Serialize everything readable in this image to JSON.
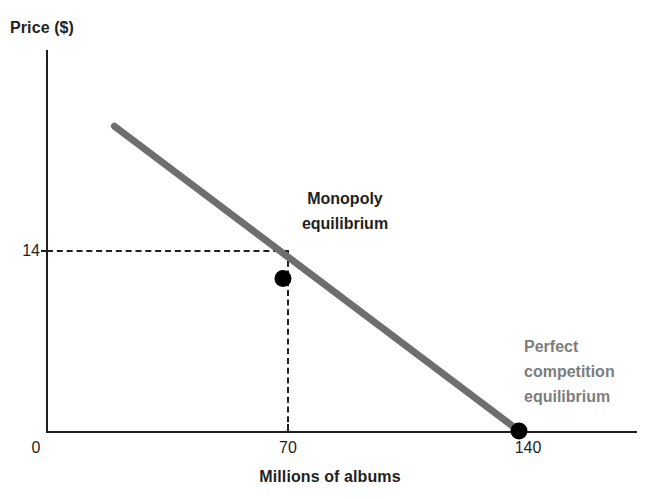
{
  "chart_data": {
    "type": "line",
    "title": "",
    "subtitle": "",
    "xlabel": "Millions of albums",
    "ylabel": "Price ($)",
    "xlim": [
      0,
      175
    ],
    "ylim": [
      0,
      35
    ],
    "grid": false,
    "legend_position": "none",
    "xticks": [
      "0",
      "70",
      "140"
    ],
    "xtick_values": [
      0,
      70,
      140
    ],
    "yticks": [
      "14"
    ],
    "ytick_values": [
      14
    ],
    "series": [
      {
        "name": "Demand curve",
        "color": "#6e6e6e",
        "x": [
          20,
          140
        ],
        "y": [
          28,
          0
        ]
      }
    ],
    "points": [
      {
        "name": "Monopoly equilibrium",
        "x": 70,
        "y": 14,
        "color": "#000000",
        "label": "Monopoly equilibrium",
        "label_color": "#231f20",
        "label_lines": [
          "Monopoly",
          "equilibrium"
        ]
      },
      {
        "name": "Perfect competition equilibrium",
        "x": 140,
        "y": 0,
        "color": "#000000",
        "label": "Perfect competition equilibrium",
        "label_color": "#7d7d7d",
        "label_lines": [
          "Perfect",
          "competition",
          "equilibrium"
        ]
      }
    ],
    "annotations": [
      {
        "text": "Monopoly equilibrium",
        "lines": [
          "Monopoly",
          "equilibrium"
        ],
        "color": "#231f20"
      },
      {
        "text": "Perfect competition equilibrium",
        "lines": [
          "Perfect",
          "competition",
          "equilibrium"
        ],
        "color": "#7d7d7d"
      }
    ],
    "guides": [
      {
        "name": "price-guide",
        "orientation": "horizontal",
        "value": 14,
        "style": "dashed"
      },
      {
        "name": "quantity-guide",
        "orientation": "vertical",
        "value": 70,
        "style": "dashed"
      }
    ]
  },
  "axes": {
    "y_title": "Price ($)",
    "x_title": "Millions of albums",
    "y_ticks": [
      {
        "label": "14"
      }
    ],
    "x_ticks": [
      {
        "label": "0"
      },
      {
        "label": "70"
      },
      {
        "label": "140"
      }
    ]
  },
  "annotations": {
    "monopoly": {
      "line1": "Monopoly",
      "line2": "equilibrium"
    },
    "perfect_competition": {
      "line1": "Perfect",
      "line2": "competition",
      "line3": "equilibrium"
    }
  },
  "colors": {
    "axis": "#231f20",
    "demand_line": "#6e6e6e",
    "point": "#000000",
    "monopoly_label": "#231f20",
    "perfect_competition_label": "#7d7d7d",
    "background": "#ffffff"
  }
}
